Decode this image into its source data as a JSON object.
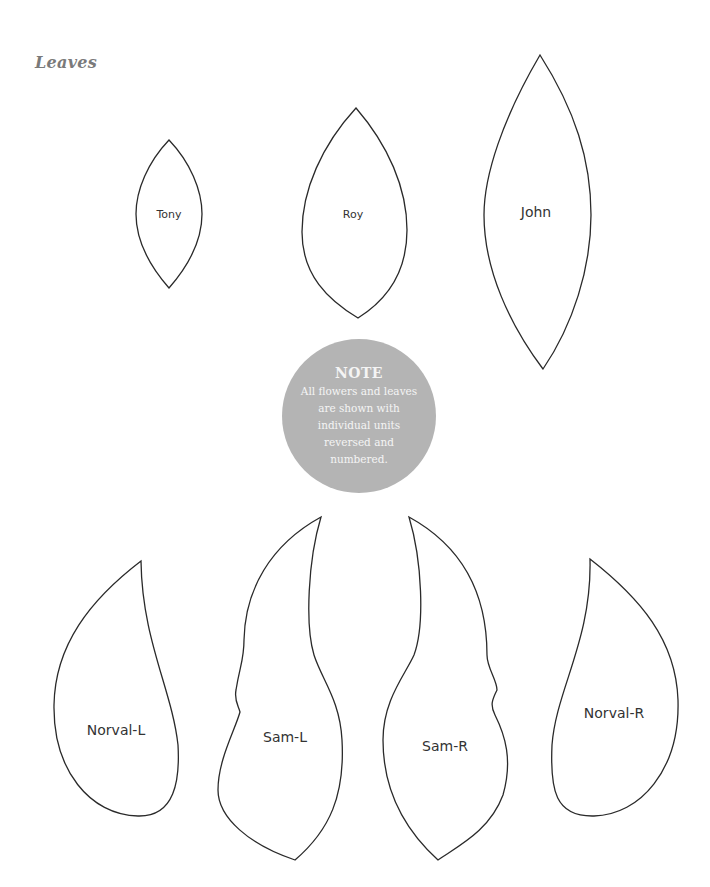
{
  "page": {
    "title": "Leaves"
  },
  "leaves": [
    {
      "name": "Tony",
      "shape": "small-pointed-oval"
    },
    {
      "name": "Roy",
      "shape": "medium-pointed-oval"
    },
    {
      "name": "John",
      "shape": "tall-pointed-oval"
    },
    {
      "name": "Norval-L",
      "shape": "teardrop-left"
    },
    {
      "name": "Sam-L",
      "shape": "curved-flame-left"
    },
    {
      "name": "Sam-R",
      "shape": "curved-flame-right"
    },
    {
      "name": "Norval-R",
      "shape": "teardrop-right"
    }
  ],
  "note": {
    "title": "NOTE",
    "body": "All flowers and leaves are shown with individual units reversed and numbered.",
    "background_color": "#b4b4b4",
    "text_color": "#f4f4f4"
  },
  "colors": {
    "title": "#7a7a7a",
    "outline": "#2a2a2a",
    "label": "#333333"
  }
}
